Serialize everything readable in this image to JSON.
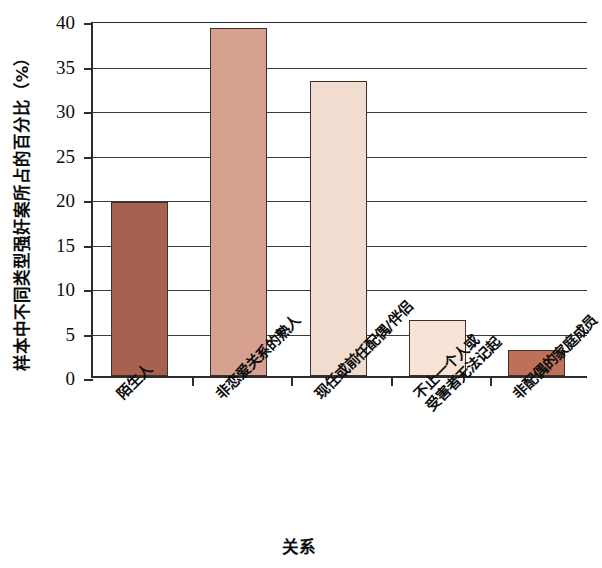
{
  "chart_data": {
    "type": "bar",
    "title": "",
    "xlabel": "关系",
    "ylabel": "样本中不同类型强奸案所占的百分比（%）",
    "categories": [
      "陌生人",
      "非恋爱关系的熟人",
      "现任或前任配偶/伴侣",
      "不止一个人或\n受害者无法记起",
      "非配偶的家庭成员"
    ],
    "category_lines": [
      [
        "陌生人"
      ],
      [
        "非恋爱关系的熟人"
      ],
      [
        "现任或前任配偶/伴侣"
      ],
      [
        "不止一个人或",
        "受害者无法记起"
      ],
      [
        "非配偶的家庭成员"
      ]
    ],
    "values": [
      19.5,
      39.1,
      33.1,
      6.3,
      2.9
    ],
    "bar_colors": [
      "#a9614f",
      "#d6a18f",
      "#f1ddd0",
      "#f7e4d6",
      "#bf7059"
    ],
    "bar_edge_color": "#40302c",
    "ylim": [
      0,
      40
    ],
    "yticks": [
      0,
      5,
      10,
      15,
      20,
      25,
      30,
      35,
      40
    ],
    "ytick_labels": [
      "0",
      "5",
      "10",
      "15",
      "20",
      "25",
      "30",
      "35",
      "40"
    ],
    "grid": true,
    "grid_axis": "y",
    "legend": "none",
    "axis_color": "#2c2c2c",
    "background": "#ffffff"
  }
}
